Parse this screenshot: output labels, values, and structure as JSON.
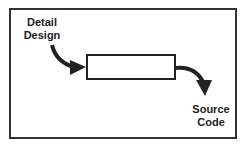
{
  "diagram": {
    "input": {
      "line1": "Detail",
      "line2": "Design"
    },
    "process": {
      "label": ""
    },
    "output": {
      "line1": "Source",
      "line2": "Code"
    }
  }
}
